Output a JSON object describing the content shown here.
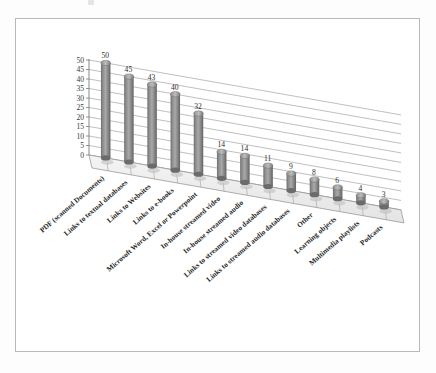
{
  "page": {
    "background": "#ffffff",
    "border_color": "#b9b9b9"
  },
  "chart_data": {
    "type": "bar",
    "style": "3d-cylinder",
    "title": "",
    "subtitle": "",
    "xlabel": "",
    "ylabel": "",
    "ylim": [
      0,
      50
    ],
    "ytick_step": 5,
    "grid": true,
    "legend": "none",
    "bar_color": "#8c8c8c",
    "bar_color_dark": "#6e6e6e",
    "bar_color_light": "#b6b6b6",
    "categories": [
      "PDF (scanned Documents)",
      "Links to textual databases",
      "Links to Websites",
      "Links to e-books",
      "Microsoft Word, Excel or Powerpoint",
      "In-house streamed video",
      "In-house streamed audio",
      "Links to streamed video databases",
      "Links to streamed audio databases",
      "Other",
      "Learning objects",
      "Multimedia playlists",
      "Podcasts"
    ],
    "values": [
      50,
      45,
      43,
      40,
      32,
      14,
      14,
      11,
      9,
      8,
      6,
      4,
      3
    ],
    "ytick_labels": [
      "0",
      "5",
      "10",
      "15",
      "20",
      "25",
      "30",
      "35",
      "40",
      "45",
      "50"
    ],
    "value_labels": [
      "50",
      "45",
      "43",
      "40",
      "32",
      "14",
      "14",
      "11",
      "9",
      "8",
      "6",
      "4",
      "3"
    ]
  }
}
